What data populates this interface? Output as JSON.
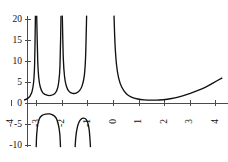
{
  "chart_data": {
    "type": "line",
    "title": "",
    "subtitle": "",
    "xlabel": "",
    "ylabel": "",
    "xlim": [
      -4.5,
      4.4
    ],
    "ylim": [
      -11.5,
      21.5
    ],
    "grid": false,
    "legend": null,
    "background_color": "#ffffff",
    "curve_color": "#111111",
    "axis_color": "#4a4a52",
    "x_ticks": [
      {
        "value": -4,
        "label": "-4"
      },
      {
        "value": -3,
        "label": "-3"
      },
      {
        "value": -2,
        "label": "-2"
      },
      {
        "value": -1,
        "label": "-1"
      },
      {
        "value": 0,
        "label": "0"
      },
      {
        "value": 1,
        "label": "1"
      },
      {
        "value": 2,
        "label": "2"
      },
      {
        "value": 3,
        "label": "3"
      },
      {
        "value": 4,
        "label": "4"
      }
    ],
    "y_ticks": [
      {
        "value": 20,
        "label": "20"
      },
      {
        "value": 15,
        "label": "15"
      },
      {
        "value": 10,
        "label": "10"
      },
      {
        "value": 5,
        "label": "5"
      },
      {
        "value": 0,
        "label": "0"
      },
      {
        "value": -5,
        "label": "-5"
      },
      {
        "value": -10,
        "label": "-10"
      }
    ],
    "x_tick_label_rotation": -90,
    "y_tick_label_rotation": 0,
    "vertical_asymptotes": [
      -4.15,
      -3.05,
      -2.05,
      -1.05,
      0.0
    ],
    "clip_top": 20.8,
    "clip_bottom": -10.5,
    "branches": [
      {
        "name": "far-left-partial",
        "x_range": [
          -4.45,
          -4.15
        ],
        "description": "descending steeply from clipped top toward a shallow trough just above zero",
        "points": [
          {
            "x": -4.45,
            "y": 20.8
          },
          {
            "x": -4.42,
            "y": 12.0
          },
          {
            "x": -4.39,
            "y": 7.0
          },
          {
            "x": -4.35,
            "y": 4.2
          },
          {
            "x": -4.28,
            "y": 2.1
          },
          {
            "x": -4.18,
            "y": 1.0
          },
          {
            "x": -4.05,
            "y": 0.55
          },
          {
            "x": -3.85,
            "y": 0.42
          },
          {
            "x": -3.6,
            "y": 0.55
          },
          {
            "x": -3.35,
            "y": 1.1
          },
          {
            "x": -3.2,
            "y": 2.4
          },
          {
            "x": -3.12,
            "y": 5.0
          },
          {
            "x": -3.08,
            "y": 9.5
          },
          {
            "x": -3.05,
            "y": 20.8
          }
        ]
      },
      {
        "name": "upper-branch-1",
        "x_range": [
          -3.05,
          -2.05
        ],
        "description": "U-shaped branch between asymptotes at -3 and -2, minimum near y=1.8",
        "points": [
          {
            "x": -3.0,
            "y": 20.8
          },
          {
            "x": -2.96,
            "y": 10.0
          },
          {
            "x": -2.92,
            "y": 6.0
          },
          {
            "x": -2.86,
            "y": 3.8
          },
          {
            "x": -2.76,
            "y": 2.4
          },
          {
            "x": -2.6,
            "y": 1.85
          },
          {
            "x": -2.45,
            "y": 1.8
          },
          {
            "x": -2.3,
            "y": 2.2
          },
          {
            "x": -2.2,
            "y": 3.2
          },
          {
            "x": -2.14,
            "y": 5.0
          },
          {
            "x": -2.09,
            "y": 9.0
          },
          {
            "x": -2.05,
            "y": 20.8
          }
        ]
      },
      {
        "name": "upper-branch-2",
        "x_range": [
          -2.05,
          -1.05
        ],
        "description": "U-shaped branch between asymptotes at -2 and -1, minimum near y=2.3",
        "points": [
          {
            "x": -2.0,
            "y": 20.8
          },
          {
            "x": -1.96,
            "y": 10.5
          },
          {
            "x": -1.91,
            "y": 6.2
          },
          {
            "x": -1.84,
            "y": 4.0
          },
          {
            "x": -1.73,
            "y": 2.7
          },
          {
            "x": -1.6,
            "y": 2.3
          },
          {
            "x": -1.46,
            "y": 2.35
          },
          {
            "x": -1.32,
            "y": 3.0
          },
          {
            "x": -1.22,
            "y": 4.2
          },
          {
            "x": -1.14,
            "y": 6.5
          },
          {
            "x": -1.09,
            "y": 11.0
          },
          {
            "x": -1.05,
            "y": 20.8
          }
        ]
      },
      {
        "name": "right-branch",
        "x_range": [
          0.0,
          4.3
        ],
        "description": "falls from asymptote at x=0, flattens near y=0.7 around x=1.6, then rises to about y=6 at x=4.3",
        "points": [
          {
            "x": 0.02,
            "y": 20.8
          },
          {
            "x": 0.06,
            "y": 14.0
          },
          {
            "x": 0.12,
            "y": 9.0
          },
          {
            "x": 0.2,
            "y": 6.0
          },
          {
            "x": 0.32,
            "y": 3.8
          },
          {
            "x": 0.5,
            "y": 2.2
          },
          {
            "x": 0.7,
            "y": 1.4
          },
          {
            "x": 0.95,
            "y": 0.95
          },
          {
            "x": 1.2,
            "y": 0.75
          },
          {
            "x": 1.5,
            "y": 0.68
          },
          {
            "x": 1.8,
            "y": 0.72
          },
          {
            "x": 2.1,
            "y": 0.9
          },
          {
            "x": 2.4,
            "y": 1.2
          },
          {
            "x": 2.7,
            "y": 1.7
          },
          {
            "x": 3.0,
            "y": 2.3
          },
          {
            "x": 3.3,
            "y": 3.0
          },
          {
            "x": 3.6,
            "y": 3.8
          },
          {
            "x": 3.9,
            "y": 4.8
          },
          {
            "x": 4.25,
            "y": 6.0
          }
        ]
      },
      {
        "name": "lower-arc-1",
        "x_range": [
          -3.05,
          -2.05
        ],
        "description": "inverted arc below the axis between asymptotes at -3 and -2, peak near y=-2.6",
        "points": [
          {
            "x": -3.02,
            "y": -10.5
          },
          {
            "x": -3.0,
            "y": -7.5
          },
          {
            "x": -2.96,
            "y": -5.2
          },
          {
            "x": -2.9,
            "y": -3.8
          },
          {
            "x": -2.8,
            "y": -3.0
          },
          {
            "x": -2.65,
            "y": -2.65
          },
          {
            "x": -2.5,
            "y": -2.6
          },
          {
            "x": -2.36,
            "y": -2.9
          },
          {
            "x": -2.24,
            "y": -3.6
          },
          {
            "x": -2.16,
            "y": -5.0
          },
          {
            "x": -2.1,
            "y": -7.2
          },
          {
            "x": -2.07,
            "y": -10.5
          }
        ]
      },
      {
        "name": "lower-arc-2",
        "x_range": [
          -1.55,
          -0.95
        ],
        "description": "inverted arc below the axis, peak near y=-3.6",
        "points": [
          {
            "x": -1.5,
            "y": -10.5
          },
          {
            "x": -1.47,
            "y": -8.0
          },
          {
            "x": -1.42,
            "y": -6.0
          },
          {
            "x": -1.35,
            "y": -4.6
          },
          {
            "x": -1.26,
            "y": -3.8
          },
          {
            "x": -1.16,
            "y": -3.6
          },
          {
            "x": -1.07,
            "y": -3.9
          },
          {
            "x": -1.0,
            "y": -4.8
          },
          {
            "x": -0.95,
            "y": -6.4
          },
          {
            "x": -0.92,
            "y": -8.5
          },
          {
            "x": -0.9,
            "y": -10.5
          }
        ]
      },
      {
        "name": "lower-stub-left",
        "x_range": [
          -4.2,
          -4.1
        ],
        "description": "short vertical stub descending below the axis just left of the -4 asymptote",
        "points": [
          {
            "x": -4.12,
            "y": -0.3
          },
          {
            "x": -4.13,
            "y": -3.0
          },
          {
            "x": -4.14,
            "y": -7.0
          },
          {
            "x": -4.15,
            "y": -10.5
          }
        ]
      }
    ]
  },
  "figure": {
    "caption": "",
    "alt": "Graph of a periodic function with vertical asymptotes"
  }
}
